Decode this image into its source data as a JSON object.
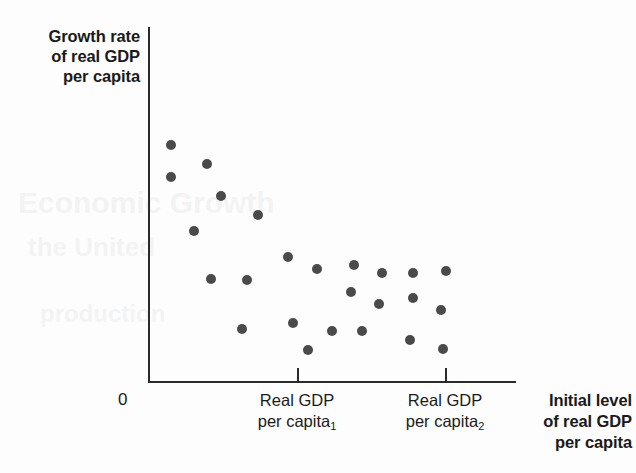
{
  "figure": {
    "y_axis_label_lines": [
      "Growth rate",
      "of real GDP",
      "per capita"
    ],
    "origin_label": "0",
    "x_axis_title_lines": [
      "Initial level",
      "of real GDP",
      "per capita"
    ],
    "tick_labels": [
      {
        "line1": "Real GDP",
        "line2": "per capita",
        "subscript": "1"
      },
      {
        "line1": "Real GDP",
        "line2": "per capita",
        "subscript": "2"
      }
    ],
    "colors": {
      "background": "#fdfdfd",
      "axis": "#2b2b2b",
      "point": "#4a4a4a",
      "text": "#1a1a1a"
    },
    "ghost_text": [
      "Economic Growth",
      "the United",
      "production"
    ]
  },
  "chart_data": {
    "type": "scatter",
    "title": "",
    "xlabel": "Initial level of real GDP per capita",
    "ylabel": "Growth rate of real GDP per capita",
    "grid": false,
    "legend": "none",
    "axis_has_numeric_ticks": false,
    "xlim": [
      0,
      368
    ],
    "ylim": [
      0,
      355
    ],
    "x_tick_positions": [
      149,
      297
    ],
    "x_tick_labels": [
      "Real GDP per capita 1",
      "Real GDP per capita 2"
    ],
    "relationship": "negative (convergence): growth rate declines as initial real GDP per capita rises",
    "points": [
      {
        "x": 23,
        "y": 118
      },
      {
        "x": 23,
        "y": 150
      },
      {
        "x": 59,
        "y": 137
      },
      {
        "x": 73,
        "y": 169
      },
      {
        "x": 46,
        "y": 204
      },
      {
        "x": 110,
        "y": 188
      },
      {
        "x": 63,
        "y": 252
      },
      {
        "x": 99,
        "y": 253
      },
      {
        "x": 140,
        "y": 230
      },
      {
        "x": 169,
        "y": 242
      },
      {
        "x": 94,
        "y": 302
      },
      {
        "x": 145,
        "y": 296
      },
      {
        "x": 160,
        "y": 323
      },
      {
        "x": 203,
        "y": 265
      },
      {
        "x": 206,
        "y": 238
      },
      {
        "x": 184,
        "y": 304
      },
      {
        "x": 214,
        "y": 304
      },
      {
        "x": 231,
        "y": 277
      },
      {
        "x": 234,
        "y": 246
      },
      {
        "x": 265,
        "y": 246
      },
      {
        "x": 265,
        "y": 271
      },
      {
        "x": 262,
        "y": 313
      },
      {
        "x": 293,
        "y": 283
      },
      {
        "x": 298,
        "y": 244
      },
      {
        "x": 295,
        "y": 322
      }
    ]
  }
}
